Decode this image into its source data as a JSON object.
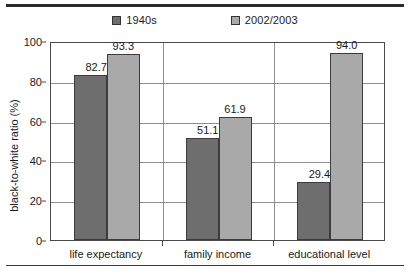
{
  "chart_data": {
    "type": "bar",
    "title": "",
    "xlabel": "",
    "ylabel": "black-to-white ratio (%)",
    "ylim": [
      0,
      100
    ],
    "yticks": [
      0,
      20,
      40,
      60,
      80,
      100
    ],
    "grid": true,
    "legend_position": "top",
    "categories": [
      "life expectancy",
      "family income",
      "educational level"
    ],
    "series": [
      {
        "name": "1940s",
        "color": "#6e6e6e",
        "values": [
          82.7,
          51.1,
          29.4
        ],
        "labels": [
          "82.7",
          "51.1",
          "29.4"
        ]
      },
      {
        "name": "2002/2003",
        "color": "#a9a9a9",
        "values": [
          93.3,
          61.9,
          94.0
        ],
        "labels": [
          "93.3",
          "61.9",
          "94.0"
        ]
      }
    ]
  },
  "axis": {
    "y_title": "black-to-white ratio (%)",
    "y_tick_labels": [
      "100",
      "80",
      "60",
      "40",
      "20",
      "0"
    ],
    "x_tick_labels": [
      "life expectancy",
      "family income",
      "educational level"
    ]
  },
  "legend": {
    "items": [
      {
        "label": "1940s",
        "color": "#6e6e6e"
      },
      {
        "label": "2002/2003",
        "color": "#a9a9a9"
      }
    ]
  }
}
